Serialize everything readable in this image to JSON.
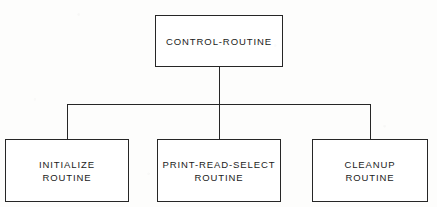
{
  "diagram": {
    "type": "hierarchy-tree",
    "line_color": "#262626",
    "background_color": "#fdfdfc",
    "text_color": "#1b1b1b",
    "root": {
      "id": "control-routine",
      "label": "CONTROL-ROUTINE",
      "lines": [
        "CONTROL-ROUTINE"
      ]
    },
    "children": [
      {
        "id": "initialize-routine",
        "label": "INITIALIZE ROUTINE",
        "lines": [
          "INITIALIZE",
          "ROUTINE"
        ]
      },
      {
        "id": "print-read-select-routine",
        "label": "PRINT-READ-SELECT ROUTINE",
        "lines": [
          "PRINT-READ-SELECT",
          "ROUTINE"
        ]
      },
      {
        "id": "cleanup-routine",
        "label": "CLEANUP ROUTINE",
        "lines": [
          "CLEANUP",
          "ROUTINE"
        ]
      }
    ]
  }
}
